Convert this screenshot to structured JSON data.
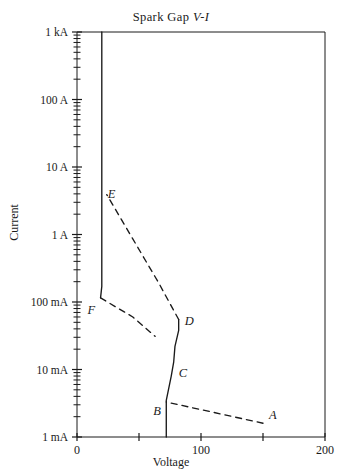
{
  "chart_data": {
    "type": "line",
    "title": "Spark Gap V-I",
    "title_plain": "Spark Gap ",
    "title_italic": "V-I",
    "xlabel": "Voltage",
    "ylabel": "Current",
    "xlim": [
      0,
      200
    ],
    "ylim": [
      0.001,
      1000
    ],
    "yscale": "log",
    "xscale": "linear",
    "grid": false,
    "legend": null,
    "xticks": [
      0,
      50,
      100,
      150,
      200
    ],
    "xtick_labels": [
      "0",
      "",
      "100",
      "",
      "200"
    ],
    "yticks": [
      0.001,
      0.01,
      0.1,
      1,
      10,
      100,
      1000
    ],
    "ytick_labels": [
      "1 mA",
      "10 mA",
      "100 mA",
      "1 A",
      "10 A",
      "100 A",
      "1 kA"
    ],
    "ytick_minor": true,
    "annotations": [
      {
        "label": "A",
        "x": 150,
        "y": 0.0018
      },
      {
        "label": "B",
        "x": 72,
        "y": 0.0029
      },
      {
        "label": "C",
        "x": 78,
        "y": 0.011
      },
      {
        "label": "D",
        "x": 82,
        "y": 0.05
      },
      {
        "label": "E",
        "x": 20,
        "y": 3.5
      },
      {
        "label": "F",
        "x": 19,
        "y": 0.11
      }
    ],
    "series": [
      {
        "name": "dark-discharge (A to B)",
        "style": "dashed",
        "points": [
          [
            150,
            0.0016
          ],
          [
            72,
            0.0033
          ]
        ]
      },
      {
        "name": "townsend / corona (B to C to D)",
        "style": "solid",
        "points": [
          [
            72,
            0.001
          ],
          [
            72,
            0.0035
          ],
          [
            76,
            0.008
          ],
          [
            78,
            0.013
          ],
          [
            79,
            0.022
          ],
          [
            82,
            0.038
          ],
          [
            82,
            0.055
          ]
        ]
      },
      {
        "name": "glow transition (D to E)",
        "style": "dashed",
        "points": [
          [
            82,
            0.055
          ],
          [
            66,
            0.19
          ],
          [
            24,
            3.9
          ]
        ]
      },
      {
        "name": "normal / abnormal glow (E to arc, vertical)",
        "style": "solid",
        "points": [
          [
            20,
            1000
          ],
          [
            20,
            0.17
          ],
          [
            19,
            0.115
          ]
        ]
      },
      {
        "name": "arc region (F onward, dashed)",
        "style": "dashed",
        "points": [
          [
            19,
            0.115
          ],
          [
            45,
            0.06
          ],
          [
            63,
            0.031
          ]
        ]
      }
    ]
  },
  "figure": {
    "axis_color": "#1a1a1a",
    "curve_color": "#1a1a1a",
    "background": "#ffffff"
  }
}
